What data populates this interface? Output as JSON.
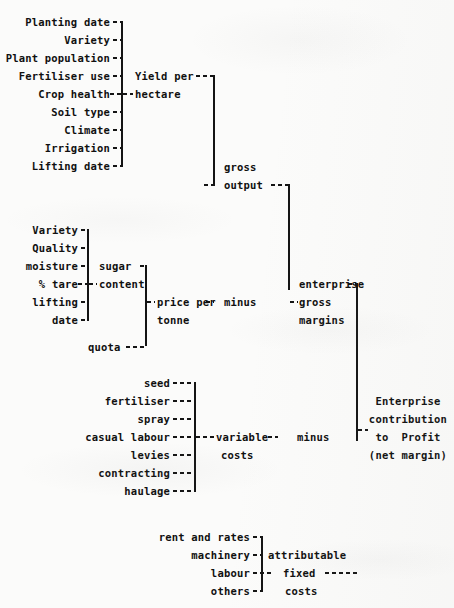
{
  "diagram": {
    "ink_color": "#141414",
    "paper_color": "#fbfbfa",
    "groups": {
      "yield_factors": {
        "output_label_line1": "Yield per",
        "output_label_line2": "hectare",
        "items": [
          "Planting date",
          "Variety",
          "Plant population",
          "Fertiliser use",
          "Crop health",
          "Soil type",
          "Climate",
          "Irrigation",
          "Lifting date"
        ]
      },
      "sugar_content": {
        "output_label_line1": "sugar",
        "output_label_line2": "content",
        "items": [
          "Variety",
          "Quality",
          "moisture",
          "% tare",
          "lifting",
          "date"
        ]
      },
      "price": {
        "quota_label": "quota",
        "output_label_line1": "price per",
        "output_label_line2": "tonne"
      },
      "variable_costs": {
        "output_label_line1": "variable",
        "output_label_line2": "costs",
        "items": [
          "seed",
          "fertiliser",
          "spray",
          "casual labour",
          "levies",
          "contracting",
          "haulage"
        ]
      },
      "fixed_costs": {
        "output_label_line1": "attributable",
        "output_label_line2": "fixed",
        "output_label_line3": "costs",
        "items": [
          "rent and rates",
          "machinery",
          "labour",
          "others"
        ]
      }
    },
    "nodes": {
      "gross_output_line1": "gross",
      "gross_output_line2": "output",
      "minus_upper": "minus",
      "minus_lower": "minus",
      "enterprise_gross_margins_line1": "enterprise",
      "enterprise_gross_margins_line2": "gross",
      "enterprise_gross_margins_line3": "margins",
      "result_line1": "Enterprise",
      "result_line2": "contribution",
      "result_line3": "to  Profit",
      "result_line4": "(net margin)"
    }
  }
}
